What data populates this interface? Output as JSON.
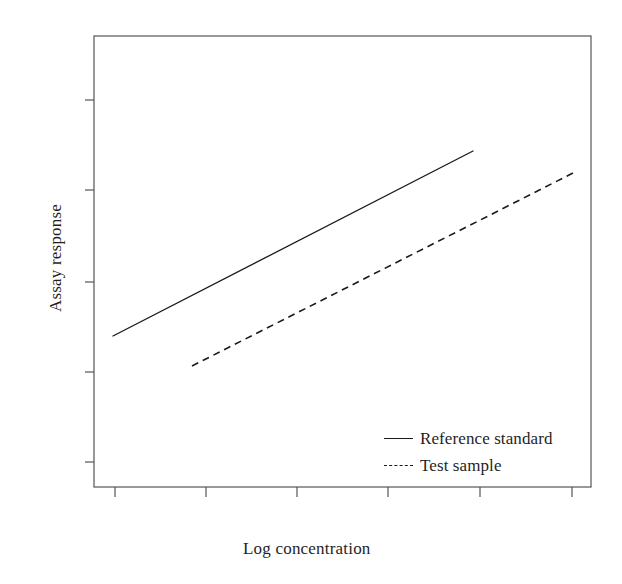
{
  "chart_data": {
    "type": "line",
    "title": "",
    "subtitle": "",
    "xlabel": "Log concentration",
    "ylabel": "Assay response",
    "grid": false,
    "legend_position": "inside bottom-right",
    "axis_tick_labels": {
      "x": [
        "",
        "",
        "",
        "",
        "",
        ""
      ],
      "y": [
        "",
        "",
        "",
        "",
        ""
      ]
    },
    "axis_ranges": {
      "xlim": [
        0,
        1
      ],
      "ylim": [
        0,
        1
      ]
    },
    "annotations": [],
    "series": [
      {
        "name": "Reference standard",
        "style": "solid",
        "color": "#1a1a1a",
        "x": [
          0.0392,
          1.0
        ],
        "y": [
          0.3348,
          0.745
        ],
        "pixel_endpoints": {
          "x1": 113,
          "y1": 336,
          "x2": 473,
          "y2": 151
        }
      },
      {
        "name": "Test sample",
        "style": "dashed",
        "color": "#1a1a1a",
        "x": [
          0.2132,
          1.2522
        ],
        "y": [
          0.2683,
          0.6984
        ],
        "pixel_endpoints": {
          "x1": 192,
          "y1": 366,
          "x2": 575,
          "y2": 172
        }
      }
    ],
    "legend": [
      {
        "label": "Reference standard",
        "style": "solid"
      },
      {
        "label": "Test sample",
        "style": "dashed"
      }
    ]
  },
  "plot_frame": {
    "left": 94,
    "top": 36,
    "right": 591,
    "bottom": 487,
    "border_color": "#555555",
    "background": "#ffffff"
  },
  "ticks": {
    "y_positions": [
      100,
      190,
      282,
      372,
      462
    ],
    "x_positions": [
      115,
      206,
      297,
      388,
      480,
      572
    ],
    "length": 9,
    "color": "#555555"
  }
}
